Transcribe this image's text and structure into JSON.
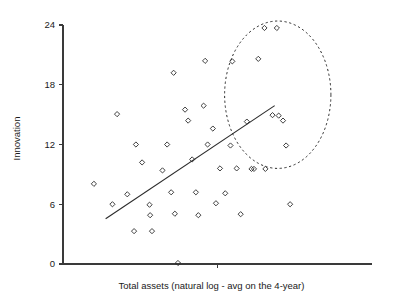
{
  "chart_data": {
    "type": "scatter",
    "title": "",
    "xlabel": "Total assets (natural log - avg on the 4-year)",
    "ylabel": "Innovation",
    "grid": false,
    "legend": null,
    "ylim": [
      0,
      24
    ],
    "yticks": [
      0,
      6,
      12,
      18,
      24
    ],
    "ytick_labels": [
      "0",
      "6",
      "12",
      "18",
      "24"
    ],
    "xlim": [
      0,
      10
    ],
    "xticks": [
      5.0
    ],
    "xtick_labels": [
      ""
    ],
    "annotations": [
      {
        "name": "outlier-group-ellipse",
        "shape": "ellipse",
        "style": "dashed",
        "cx": 6.95,
        "cy": 17.0,
        "rx": 1.72,
        "ry": 7.4
      }
    ],
    "trend": {
      "name": "regression-line",
      "type": "line",
      "x": [
        1.38,
        6.85
      ],
      "y": [
        4.55,
        15.9
      ]
    },
    "points": [
      {
        "x": 1.0,
        "y": 8.05
      },
      {
        "x": 1.6,
        "y": 6.0
      },
      {
        "x": 1.75,
        "y": 15.05
      },
      {
        "x": 2.08,
        "y": 7.0
      },
      {
        "x": 2.3,
        "y": 3.3
      },
      {
        "x": 2.36,
        "y": 12.0
      },
      {
        "x": 2.56,
        "y": 10.2
      },
      {
        "x": 2.8,
        "y": 5.95
      },
      {
        "x": 2.82,
        "y": 4.9
      },
      {
        "x": 2.88,
        "y": 3.3
      },
      {
        "x": 3.22,
        "y": 9.4
      },
      {
        "x": 3.37,
        "y": 12.0
      },
      {
        "x": 3.5,
        "y": 7.2
      },
      {
        "x": 3.58,
        "y": 19.2
      },
      {
        "x": 3.62,
        "y": 5.05
      },
      {
        "x": 3.72,
        "y": 0.1
      },
      {
        "x": 3.95,
        "y": 15.5
      },
      {
        "x": 4.05,
        "y": 14.4
      },
      {
        "x": 4.18,
        "y": 10.5
      },
      {
        "x": 4.3,
        "y": 7.2
      },
      {
        "x": 4.38,
        "y": 4.9
      },
      {
        "x": 4.55,
        "y": 15.9
      },
      {
        "x": 4.6,
        "y": 20.4
      },
      {
        "x": 4.68,
        "y": 12.0
      },
      {
        "x": 4.85,
        "y": 13.6
      },
      {
        "x": 4.95,
        "y": 6.1
      },
      {
        "x": 5.08,
        "y": 9.6
      },
      {
        "x": 5.25,
        "y": 7.1
      },
      {
        "x": 5.42,
        "y": 11.9
      },
      {
        "x": 5.48,
        "y": 20.35
      },
      {
        "x": 5.62,
        "y": 9.6
      },
      {
        "x": 5.75,
        "y": 5.0
      },
      {
        "x": 5.95,
        "y": 14.3
      },
      {
        "x": 6.1,
        "y": 9.55
      },
      {
        "x": 6.18,
        "y": 9.55
      },
      {
        "x": 6.32,
        "y": 20.6
      },
      {
        "x": 6.52,
        "y": 23.7
      },
      {
        "x": 6.55,
        "y": 9.55
      },
      {
        "x": 6.78,
        "y": 14.95
      },
      {
        "x": 6.92,
        "y": 23.7
      },
      {
        "x": 6.98,
        "y": 14.9
      },
      {
        "x": 7.12,
        "y": 14.4
      },
      {
        "x": 7.22,
        "y": 11.9
      },
      {
        "x": 7.35,
        "y": 6.0
      }
    ]
  }
}
